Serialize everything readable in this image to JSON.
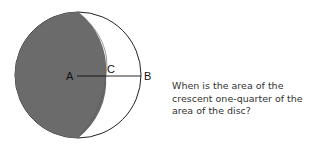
{
  "diagram": {
    "labels": {
      "a": "A",
      "b": "B",
      "c": "C"
    },
    "colors": {
      "crescent": "#6b6b6b",
      "outline": "#222222",
      "background": "#ffffff"
    }
  },
  "question": {
    "text": "When is the area of the crescent one-quarter of the area of the disc?"
  }
}
